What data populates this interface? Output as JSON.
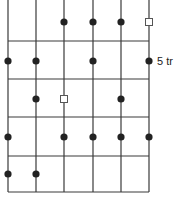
{
  "diagram": {
    "columns": 6,
    "rows": 5,
    "marker_types": {
      "dot": "filled-circle",
      "square": "hollow-square",
      "none": "empty"
    },
    "grid": [
      [
        "none",
        "none",
        "dot",
        "dot",
        "dot",
        "square"
      ],
      [
        "dot",
        "dot",
        "none",
        "dot",
        "none",
        "dot"
      ],
      [
        "none",
        "dot",
        "square",
        "none",
        "dot",
        "none"
      ],
      [
        "dot",
        "none",
        "dot",
        "dot",
        "dot",
        "dot"
      ],
      [
        "dot",
        "dot",
        "none",
        "none",
        "none",
        "none"
      ]
    ],
    "row_labels": [
      "",
      "5 tr",
      "",
      "",
      ""
    ],
    "colors": {
      "line": "#3a3a3a",
      "dot": "#222222",
      "square_stroke": "#555555",
      "background": "#ffffff"
    }
  }
}
